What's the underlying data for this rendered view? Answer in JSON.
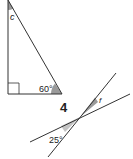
{
  "figure_1": {
    "type": "right-triangle",
    "angle_top_label": "c",
    "angle_bottom_right_label": "60°",
    "right_angle_marker": true
  },
  "figure_2": {
    "number_label": "4",
    "type": "intersecting-lines",
    "angle_upper_label": "f",
    "angle_lower_label": "25°"
  },
  "colors": {
    "line": "#333333",
    "shade": "#9a9a9a",
    "shade_light": "#c4c4c4"
  }
}
